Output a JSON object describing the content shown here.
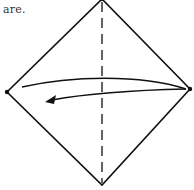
{
  "caption": {
    "text": "are."
  },
  "diagram": {
    "type": "origami-fold-step",
    "shape": "square-on-point",
    "fold_line": "vertical-center-valley",
    "action": "fold right corner to left corner",
    "colors": {
      "stroke": "#111111",
      "background": "#ffffff"
    },
    "vertices": {
      "top": [
        102,
        0
      ],
      "right": [
        190,
        89
      ],
      "bottom": [
        102,
        185
      ],
      "left": [
        7,
        92
      ]
    }
  }
}
